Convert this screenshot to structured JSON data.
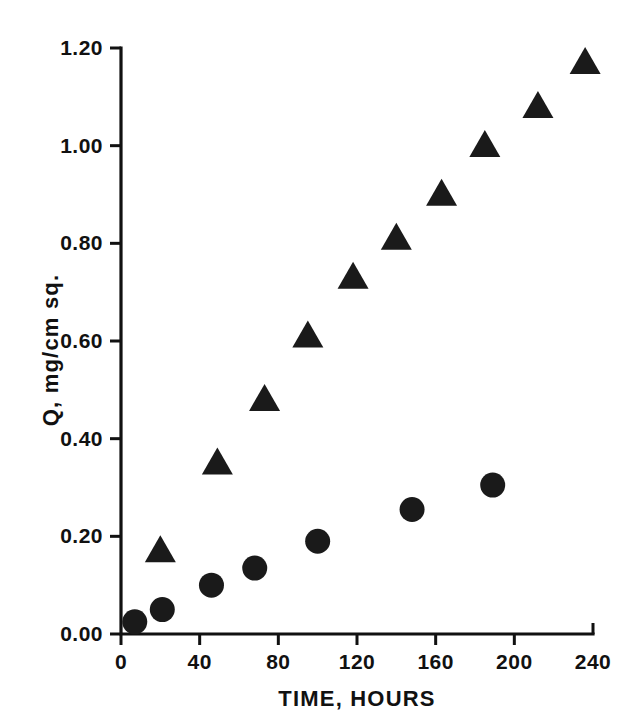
{
  "chart_data": {
    "type": "scatter",
    "title": "",
    "xlabel": "TIME,  HOURS",
    "ylabel": "Q, mg/cm sq.",
    "xlim": [
      0,
      240
    ],
    "ylim": [
      0.0,
      1.2
    ],
    "xticks": [
      0,
      40,
      80,
      120,
      160,
      200,
      240
    ],
    "xtick_labels": [
      "0",
      "40",
      "80",
      "120",
      "160",
      "200",
      "240"
    ],
    "yticks": [
      0.0,
      0.2,
      0.4,
      0.6,
      0.8,
      1.0,
      1.2
    ],
    "ytick_labels": [
      "0.00",
      "0.20",
      "0.40",
      "0.60",
      "0.80",
      "1.00",
      "1.20"
    ],
    "grid": false,
    "legend": null,
    "series": [
      {
        "name": "triangle-series",
        "marker": "triangle",
        "color": "#1a1a1a",
        "points": [
          {
            "x": 20,
            "y": 0.17
          },
          {
            "x": 49,
            "y": 0.35
          },
          {
            "x": 73,
            "y": 0.48
          },
          {
            "x": 95,
            "y": 0.61
          },
          {
            "x": 118,
            "y": 0.73
          },
          {
            "x": 140,
            "y": 0.81
          },
          {
            "x": 163,
            "y": 0.9
          },
          {
            "x": 185,
            "y": 1.0
          },
          {
            "x": 212,
            "y": 1.08
          },
          {
            "x": 236,
            "y": 1.17
          }
        ]
      },
      {
        "name": "circle-series",
        "marker": "circle",
        "color": "#1a1a1a",
        "points": [
          {
            "x": 7,
            "y": 0.025
          },
          {
            "x": 21,
            "y": 0.05
          },
          {
            "x": 46,
            "y": 0.1
          },
          {
            "x": 68,
            "y": 0.135
          },
          {
            "x": 100,
            "y": 0.19
          },
          {
            "x": 148,
            "y": 0.255
          },
          {
            "x": 189,
            "y": 0.305
          }
        ]
      }
    ]
  },
  "geometry": {
    "x0_px": 121,
    "x1_px": 593,
    "y0_px": 634,
    "y1_px": 48,
    "tick_len": 11,
    "circle_r": 12.5,
    "triangle_half": 15.5,
    "triangle_h": 27
  }
}
